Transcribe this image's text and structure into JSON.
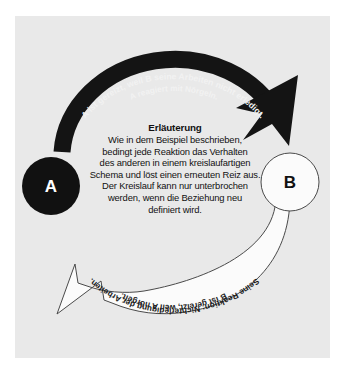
{
  "figure": {
    "background_color": "#ffffff",
    "panel_color": "#e9e9e9"
  },
  "nodes": [
    {
      "id": "A",
      "label": "A",
      "fill": "#111111",
      "text_color": "#ffffff"
    },
    {
      "id": "B",
      "label": "B",
      "fill": "#fbfbfb",
      "text_color": "#111111"
    }
  ],
  "arrows": [
    {
      "id": "a-to-b",
      "from": "A",
      "to": "B",
      "style": "solid-black",
      "color": "#141414",
      "text_color": "#f2f2f2",
      "line1": "A ist gereizt, weil B seine Arbeiten nicht erledigt.",
      "line2": "A reagiert mit Nörgeln."
    },
    {
      "id": "b-to-a",
      "from": "B",
      "to": "A",
      "style": "outlined-white",
      "color": "#fbfbfb",
      "text_color": "#1a1a1a",
      "line1": "B ist gereizt, weil A nörgelt.",
      "line2": "Seine Reaktion: Nichterledigung der Arbeiten."
    }
  ],
  "explanation": {
    "heading": "Erläuterung",
    "lines": [
      "Wie in dem Beispiel beschrieben,",
      "bedingt jede Reaktion das Verhalten",
      "des anderen in einem kreislaufartigen",
      "Schema und löst einen erneuten Reiz aus.",
      "Der Kreislauf kann nur unterbrochen",
      "werden, wenn die Beziehung neu",
      "definiert wird."
    ]
  }
}
